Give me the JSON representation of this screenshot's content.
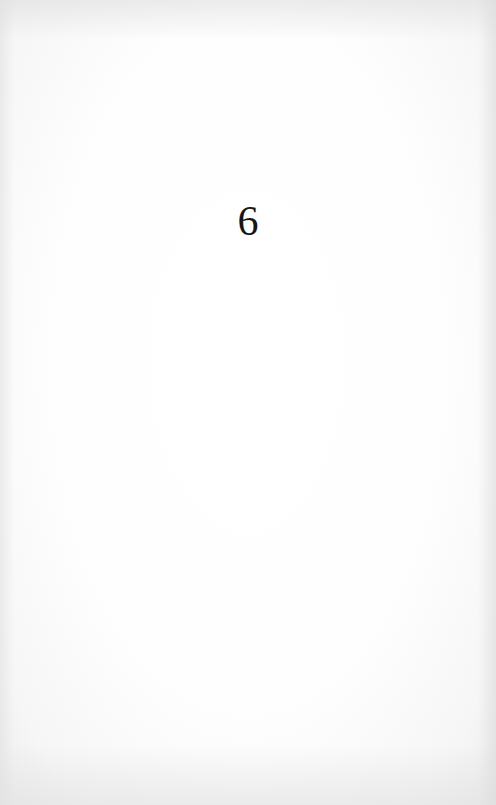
{
  "page": {
    "chapter_number": "6",
    "background_color": "#fefefe",
    "text_color": "#161616"
  }
}
